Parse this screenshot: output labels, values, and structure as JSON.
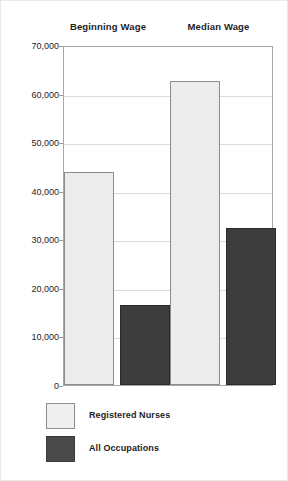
{
  "chart_data": {
    "type": "bar",
    "title": "",
    "xlabel": "",
    "ylabel": "",
    "categories": [
      "Beginning Wage",
      "Median Wage"
    ],
    "series": [
      {
        "name": "Registered Nurses",
        "color": "#ececec",
        "values": [
          43900,
          62500
        ]
      },
      {
        "name": "All Occupations",
        "color": "#3c3c3c",
        "values": [
          16500,
          32300
        ]
      }
    ],
    "ylim": [
      0,
      70000
    ],
    "ytick_values": [
      70000,
      60000,
      50000,
      40000,
      30000,
      20000,
      10000,
      0
    ],
    "ytick_labels": [
      "70,000",
      "60,000",
      "50,000",
      "40,000",
      "30,000",
      "20,000",
      "10,000",
      "0"
    ],
    "grid": true,
    "legend_position": "bottom-left",
    "legend": [
      "Registered Nurses",
      "All Occupations"
    ]
  },
  "headers": [
    {
      "label": "Beginning Wage"
    },
    {
      "label": "Median Wage"
    }
  ],
  "legend_items": [
    {
      "label": "Registered Nurses",
      "swatch": "light"
    },
    {
      "label": "All Occupations",
      "swatch": "dark"
    }
  ],
  "colors": {
    "light_bar": "#ececec",
    "dark_bar": "#3c3c3c",
    "axis": "#a6a6a6",
    "grid": "#dcdcdc",
    "text": "#1d1d1d",
    "background": "#ffffff"
  }
}
